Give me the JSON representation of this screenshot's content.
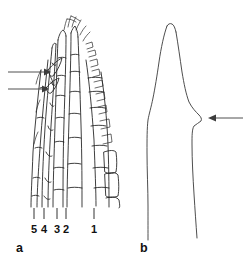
{
  "figure": {
    "background_color": "#ffffff",
    "ink_color": "#1c1c1c",
    "arrow_color": "#3c3c3c",
    "width": 252,
    "height": 268
  },
  "panels": [
    {
      "id": "a",
      "label": "a",
      "description": "segmented appendage tip with serrate margin",
      "arrows": [
        {
          "id": "arrow-a-upper",
          "direction": "right",
          "x1": 8,
          "y1": 72,
          "x2": 48,
          "y2": 72
        },
        {
          "id": "arrow-a-lower",
          "direction": "right",
          "x1": 8,
          "y1": 89,
          "x2": 48,
          "y2": 89
        }
      ],
      "scale_labels": [
        {
          "text": "5",
          "tick_x": 34,
          "label_x": 34
        },
        {
          "text": "4",
          "tick_x": 44,
          "label_x": 44
        },
        {
          "text": "3",
          "tick_x": 57,
          "label_x": 57
        },
        {
          "text": "2",
          "tick_x": 66,
          "label_x": 66
        },
        {
          "text": "1",
          "tick_x": 94,
          "label_x": 94
        }
      ],
      "tick_y_top": 208,
      "tick_y_bottom": 218,
      "label_y": 229
    },
    {
      "id": "b",
      "label": "b",
      "description": "outline of structure with lateral notch",
      "arrows": [
        {
          "id": "arrow-b",
          "direction": "left",
          "x1": 243,
          "y1": 118,
          "x2": 209,
          "y2": 118
        }
      ]
    }
  ],
  "labels": {
    "panel_a": "a",
    "panel_b": "b",
    "numbers": [
      "5",
      "4",
      "3",
      "2",
      "1"
    ]
  }
}
